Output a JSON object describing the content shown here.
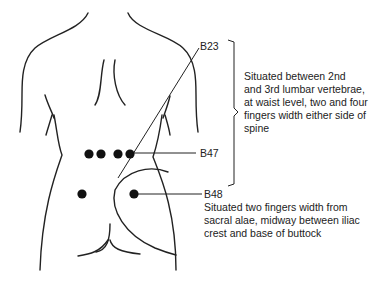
{
  "figure": {
    "type": "acupressure point diagram (lower back)",
    "colors": {
      "line": "#222222",
      "point": "#111111",
      "background": "#ffffff"
    }
  },
  "points": [
    {
      "id": "B23",
      "label": "B23",
      "description_lines": [
        "Situated between 2nd",
        "and 3rd lumbar vertebrae,",
        "at waist level, two and four",
        "fingers width either side of",
        "spine"
      ]
    },
    {
      "id": "B47",
      "label": "B47"
    },
    {
      "id": "B48",
      "label": "B48",
      "description_lines": [
        "Situated two fingers width from",
        "sacral alae, midway between iliac",
        "crest and base of buttock"
      ]
    }
  ]
}
